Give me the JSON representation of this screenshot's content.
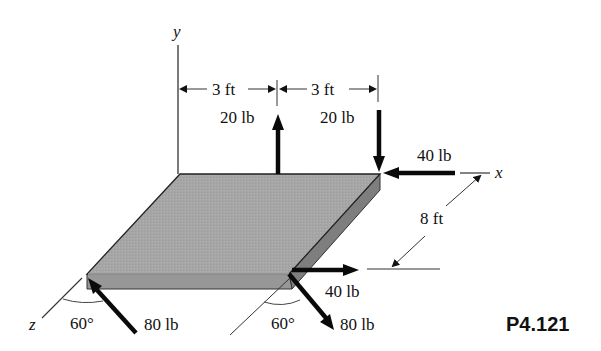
{
  "figure": {
    "problem_number": "P4.121",
    "axes": {
      "x": "x",
      "y": "y",
      "z": "z"
    },
    "dimensions": {
      "left_span": "3 ft",
      "right_span": "3 ft",
      "depth": "8 ft"
    },
    "forces": {
      "up_force": "20 lb",
      "down_force": "20 lb",
      "x_force_back": "40 lb",
      "x_force_front": "40 lb",
      "oblique_left": "80 lb",
      "oblique_right": "80 lb"
    },
    "angles": {
      "left": "60°",
      "right": "60°"
    },
    "colors": {
      "plate_top": "#a8a8a8",
      "plate_front": "#9a9a9a",
      "plate_side": "#7d7d7d",
      "arrow": "#0a0a0a"
    }
  }
}
